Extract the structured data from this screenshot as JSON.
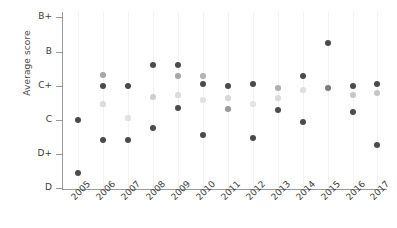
{
  "chart_data": {
    "type": "scatter",
    "title": "",
    "xlabel": "",
    "ylabel": "Average score",
    "grid": true,
    "legend": "none",
    "x": [
      "2005",
      "2006",
      "2007",
      "2008",
      "2009",
      "2010",
      "2011",
      "2012",
      "2013",
      "2014",
      "2015",
      "2016",
      "2017"
    ],
    "ytick_labels": [
      "B+",
      "B",
      "C+",
      "C",
      "D+",
      "D"
    ],
    "ytick_values": [
      5,
      4,
      3,
      2,
      1,
      0
    ],
    "ylim": [
      0,
      5
    ],
    "yscale_note": "Letter grade scale: D=0, D+=1, C=2, C+=3, B=4, B+=5",
    "series": [
      {
        "name": "series-dark-high",
        "color": "#4b4b4b",
        "values": [
          2.02,
          3.0,
          2.98,
          3.62,
          3.62,
          3.05,
          2.98,
          3.05,
          2.32,
          3.33,
          4.28,
          3.02,
          3.1
        ]
      },
      {
        "name": "series-medium",
        "color": "#9a9a9a",
        "values": [
          null,
          3.35,
          null,
          2.68,
          3.28,
          3.28,
          2.62,
          null,
          2.95,
          null,
          2.95,
          2.72,
          2.78
        ]
      },
      {
        "name": "series-light",
        "color": "#d2d2d2",
        "values": [
          null,
          2.48,
          2.08,
          null,
          2.73,
          2.58,
          2.28,
          2.48,
          2.68,
          2.88,
          null,
          null,
          null
        ]
      },
      {
        "name": "series-dark-low",
        "color": "#4b4b4b",
        "values": [
          0.48,
          1.42,
          1.42,
          1.78,
          2.35,
          1.55,
          null,
          1.48,
          null,
          1.95,
          null,
          2.28,
          1.28
        ]
      }
    ]
  },
  "points": [
    {
      "year": "2005",
      "x": 78,
      "y": 120,
      "r": 3.0,
      "color": "#4b4b4b",
      "name": "point-2005-a"
    },
    {
      "year": "2005",
      "x": 78,
      "y": 173,
      "r": 3.0,
      "color": "#4b4b4b",
      "name": "point-2005-b"
    },
    {
      "year": "2006",
      "x": 103,
      "y": 75,
      "r": 2.8,
      "color": "#a8a8a8",
      "name": "point-2006-a"
    },
    {
      "year": "2006",
      "x": 103,
      "y": 86,
      "r": 3.0,
      "color": "#4b4b4b",
      "name": "point-2006-b"
    },
    {
      "year": "2006",
      "x": 103,
      "y": 104,
      "r": 2.6,
      "color": "#dcdcdc",
      "name": "point-2006-c"
    },
    {
      "year": "2006",
      "x": 103,
      "y": 140,
      "r": 3.0,
      "color": "#4b4b4b",
      "name": "point-2006-d"
    },
    {
      "year": "2007",
      "x": 128,
      "y": 86,
      "r": 3.0,
      "color": "#4b4b4b",
      "name": "point-2007-a"
    },
    {
      "year": "2007",
      "x": 128,
      "y": 118,
      "r": 2.6,
      "color": "#e2e2e2",
      "name": "point-2007-b"
    },
    {
      "year": "2007",
      "x": 128,
      "y": 140,
      "r": 3.0,
      "color": "#4b4b4b",
      "name": "point-2007-c"
    },
    {
      "year": "2008",
      "x": 153,
      "y": 65,
      "r": 3.0,
      "color": "#4b4b4b",
      "name": "point-2008-a"
    },
    {
      "year": "2008",
      "x": 153,
      "y": 97,
      "r": 2.8,
      "color": "#cfcfcf",
      "name": "point-2008-b"
    },
    {
      "year": "2008",
      "x": 153,
      "y": 128,
      "r": 3.0,
      "color": "#4b4b4b",
      "name": "point-2008-c"
    },
    {
      "year": "2009",
      "x": 178,
      "y": 65,
      "r": 3.0,
      "color": "#4b4b4b",
      "name": "point-2009-a"
    },
    {
      "year": "2009",
      "x": 178,
      "y": 76,
      "r": 2.8,
      "color": "#a8a8a8",
      "name": "point-2009-b"
    },
    {
      "year": "2009",
      "x": 178,
      "y": 95,
      "r": 2.6,
      "color": "#dcdcdc",
      "name": "point-2009-c"
    },
    {
      "year": "2009",
      "x": 178,
      "y": 108,
      "r": 3.0,
      "color": "#4b4b4b",
      "name": "point-2009-d"
    },
    {
      "year": "2010",
      "x": 203,
      "y": 76,
      "r": 2.8,
      "color": "#b4b4b4",
      "name": "point-2010-a"
    },
    {
      "year": "2010",
      "x": 203,
      "y": 84,
      "r": 3.0,
      "color": "#4b4b4b",
      "name": "point-2010-b"
    },
    {
      "year": "2010",
      "x": 203,
      "y": 100,
      "r": 2.6,
      "color": "#e2e2e2",
      "name": "point-2010-c"
    },
    {
      "year": "2010",
      "x": 203,
      "y": 135,
      "r": 3.0,
      "color": "#4b4b4b",
      "name": "point-2010-d"
    },
    {
      "year": "2011",
      "x": 228,
      "y": 86,
      "r": 3.0,
      "color": "#4b4b4b",
      "name": "point-2011-a"
    },
    {
      "year": "2011",
      "x": 228,
      "y": 98,
      "r": 2.6,
      "color": "#d8d8d8",
      "name": "point-2011-b"
    },
    {
      "year": "2011",
      "x": 228,
      "y": 109,
      "r": 2.8,
      "color": "#9a9a9a",
      "name": "point-2011-c"
    },
    {
      "year": "2012",
      "x": 253,
      "y": 84,
      "r": 3.0,
      "color": "#4b4b4b",
      "name": "point-2012-a"
    },
    {
      "year": "2012",
      "x": 253,
      "y": 104,
      "r": 2.6,
      "color": "#e4e4e4",
      "name": "point-2012-b"
    },
    {
      "year": "2012",
      "x": 253,
      "y": 138,
      "r": 3.0,
      "color": "#4b4b4b",
      "name": "point-2012-c"
    },
    {
      "year": "2013",
      "x": 278,
      "y": 88,
      "r": 2.8,
      "color": "#b0b0b0",
      "name": "point-2013-a"
    },
    {
      "year": "2013",
      "x": 278,
      "y": 98,
      "r": 2.6,
      "color": "#dcdcdc",
      "name": "point-2013-b"
    },
    {
      "year": "2013",
      "x": 278,
      "y": 110,
      "r": 3.0,
      "color": "#4b4b4b",
      "name": "point-2013-c"
    },
    {
      "year": "2014",
      "x": 303,
      "y": 76,
      "r": 3.0,
      "color": "#4b4b4b",
      "name": "point-2014-a"
    },
    {
      "year": "2014",
      "x": 303,
      "y": 90,
      "r": 2.6,
      "color": "#e0e0e0",
      "name": "point-2014-b"
    },
    {
      "year": "2014",
      "x": 303,
      "y": 122,
      "r": 3.0,
      "color": "#4b4b4b",
      "name": "point-2014-c"
    },
    {
      "year": "2015",
      "x": 328,
      "y": 43,
      "r": 3.0,
      "color": "#4b4b4b",
      "name": "point-2015-a"
    },
    {
      "year": "2015",
      "x": 328,
      "y": 88,
      "r": 2.9,
      "color": "#7d7d7d",
      "name": "point-2015-b"
    },
    {
      "year": "2016",
      "x": 353,
      "y": 86,
      "r": 3.0,
      "color": "#4b4b4b",
      "name": "point-2016-a"
    },
    {
      "year": "2016",
      "x": 353,
      "y": 95,
      "r": 2.8,
      "color": "#c6c6c6",
      "name": "point-2016-b"
    },
    {
      "year": "2016",
      "x": 353,
      "y": 112,
      "r": 3.0,
      "color": "#4b4b4b",
      "name": "point-2016-c"
    },
    {
      "year": "2017",
      "x": 377,
      "y": 84,
      "r": 3.0,
      "color": "#4b4b4b",
      "name": "point-2017-a"
    },
    {
      "year": "2017",
      "x": 377,
      "y": 93,
      "r": 2.8,
      "color": "#c6c6c6",
      "name": "point-2017-b"
    },
    {
      "year": "2017",
      "x": 377,
      "y": 145,
      "r": 3.0,
      "color": "#4b4b4b",
      "name": "point-2017-c"
    }
  ],
  "yticks": [
    {
      "label": "B+",
      "y": 17
    },
    {
      "label": "B",
      "y": 52
    },
    {
      "label": "C+",
      "y": 86
    },
    {
      "label": "C",
      "y": 120
    },
    {
      "label": "D+",
      "y": 154
    },
    {
      "label": "D",
      "y": 188
    }
  ],
  "xticks": [
    {
      "label": "2005",
      "x": 78
    },
    {
      "label": "2006",
      "x": 103
    },
    {
      "label": "2007",
      "x": 128
    },
    {
      "label": "2008",
      "x": 153
    },
    {
      "label": "2009",
      "x": 178
    },
    {
      "label": "2010",
      "x": 203
    },
    {
      "label": "2011",
      "x": 228
    },
    {
      "label": "2012",
      "x": 253
    },
    {
      "label": "2013",
      "x": 278
    },
    {
      "label": "2014",
      "x": 303
    },
    {
      "label": "2015",
      "x": 328
    },
    {
      "label": "2016",
      "x": 353
    },
    {
      "label": "2017",
      "x": 377
    }
  ],
  "axis": {
    "y_title": "Average score",
    "line_color": "#9a9a9a",
    "grid_color": "#f2f2f2",
    "tick_text_color": "#3c3c3c"
  }
}
